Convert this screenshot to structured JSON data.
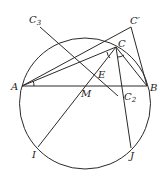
{
  "figure": {
    "type": "geometry",
    "circle": {
      "cx": 85,
      "cy": 103.5,
      "r": 65.5
    },
    "points": {
      "A": {
        "label": "A",
        "x": 22,
        "y": 86
      },
      "B": {
        "label": "B",
        "x": 147,
        "y": 86
      },
      "C": {
        "label": "C",
        "x": 116,
        "y": 47
      },
      "Cprime": {
        "label": "C′",
        "x": 131,
        "y": 27
      },
      "C3": {
        "label": "C",
        "sub": "3",
        "x": 40,
        "y": 27
      },
      "C2": {
        "label": "C",
        "sub": "2",
        "x": 118,
        "y": 96
      },
      "E": {
        "label": "E",
        "x": 96,
        "y": 72
      },
      "M": {
        "label": "M",
        "x": 80,
        "y": 86
      },
      "I": {
        "label": "I",
        "x": 38,
        "y": 147
      },
      "J": {
        "label": "J",
        "x": 131,
        "y": 148
      }
    },
    "labels": {
      "A": "A",
      "B": "B",
      "C": "C",
      "Cprime": "C′",
      "C3": "C",
      "C3_sub": "3",
      "C2": "C",
      "C2_sub": "2",
      "E": "E",
      "M": "M",
      "I": "I",
      "J": "J"
    }
  }
}
